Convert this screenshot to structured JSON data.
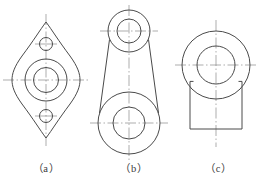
{
  "page": {
    "background_color": "#ffffff",
    "line_color": "#4a4a4a",
    "centerline_color": "#8a8a8a",
    "width": 261,
    "height": 185
  },
  "captions": {
    "a": "（a）",
    "b": "（b）",
    "c": "（c）"
  },
  "figures": [
    {
      "id": "a",
      "name": "diamond-flange-plate",
      "label": "（a）",
      "center": {
        "x": 46,
        "y": 80
      },
      "outline": {
        "type": "rounded-diamond",
        "half_width": 38,
        "half_height": 58,
        "corner_radius": 9
      },
      "circles": [
        {
          "name": "center-bore-outer",
          "cx": 46,
          "cy": 80,
          "r": 21
        },
        {
          "name": "center-bore-inner",
          "cx": 46,
          "cy": 80,
          "r": 12.5
        },
        {
          "name": "upper-hole",
          "cx": 46,
          "cy": 44,
          "r": 6.5
        },
        {
          "name": "lower-hole",
          "cx": 46,
          "cy": 116,
          "r": 6.5
        }
      ],
      "centerlines": [
        {
          "name": "vertical-centerline",
          "x1": 46,
          "y1": 14,
          "x2": 46,
          "y2": 146
        },
        {
          "name": "horizontal-centerline",
          "x1": 3,
          "y1": 80,
          "x2": 89,
          "y2": 80
        },
        {
          "name": "upper-hole-cross",
          "x1": 36,
          "y1": 44,
          "x2": 56,
          "y2": 44
        },
        {
          "name": "lower-hole-cross",
          "x1": 36,
          "y1": 116,
          "x2": 56,
          "y2": 116
        }
      ]
    },
    {
      "id": "b",
      "name": "connecting-rod",
      "label": "（b）",
      "top_boss": {
        "cx": 129,
        "cy": 31,
        "r_outer": 21,
        "r_inner": 12
      },
      "bottom_boss": {
        "cx": 129,
        "cy": 123,
        "r_outer": 31,
        "r_inner": 16
      },
      "web": {
        "type": "tangent-taper",
        "description": "two straight tangent lines joining the bosses"
      },
      "centerlines": [
        {
          "name": "vertical-centerline",
          "x1": 129,
          "y1": 5,
          "x2": 129,
          "y2": 160
        },
        {
          "name": "top-horizontal-centerline",
          "x1": 101,
          "y1": 31,
          "x2": 157,
          "y2": 31
        },
        {
          "name": "bottom-horizontal-centerline",
          "x1": 91,
          "y1": 123,
          "x2": 167,
          "y2": 123
        }
      ]
    },
    {
      "id": "c",
      "name": "bossed-block",
      "label": "（c）",
      "circles": [
        {
          "name": "boss-outer",
          "cx": 216,
          "cy": 65,
          "r": 34
        },
        {
          "name": "boss-inner",
          "cx": 216,
          "cy": 65,
          "r": 19
        }
      ],
      "base_rect": {
        "x": 190,
        "y": 80,
        "width": 52,
        "height": 49
      },
      "centerlines": [
        {
          "name": "vertical-centerline",
          "x1": 216,
          "y1": 20,
          "x2": 216,
          "y2": 147
        },
        {
          "name": "horizontal-centerline",
          "x1": 175,
          "y1": 65,
          "x2": 258,
          "y2": 65
        }
      ]
    }
  ]
}
